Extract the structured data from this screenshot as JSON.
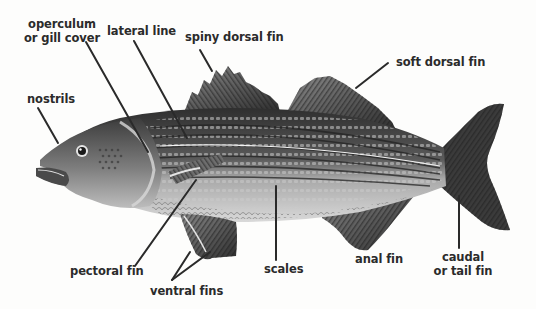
{
  "diagram": {
    "labels": {
      "operculum": {
        "line1": "operculum",
        "line2": "or gill cover"
      },
      "lateral_line": "lateral line",
      "spiny_dorsal_fin": "spiny dorsal fin",
      "soft_dorsal_fin": "soft dorsal fin",
      "nostrils": "nostrils",
      "pectoral_fin": "pectoral fin",
      "ventral_fins": "ventral fins",
      "scales": "scales",
      "anal_fin": "anal fin",
      "caudal_fin": {
        "line1": "caudal",
        "line2": "or tail fin"
      }
    },
    "colors": {
      "background": "#fdfdfc",
      "label_text": "#2b2b2b",
      "leader_line": "#2a2a2a",
      "fish_dark": "#3a3a3a",
      "fish_mid": "#7a7a7a",
      "fish_light": "#d6d6d6"
    }
  }
}
